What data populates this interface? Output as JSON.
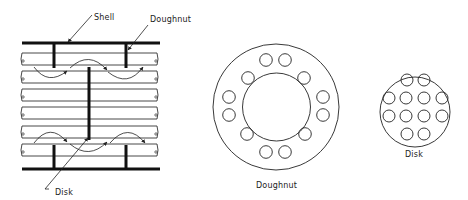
{
  "figure": {
    "side_view": {
      "labels": {
        "shell": "Shell",
        "doughnut": "Doughnut",
        "disk": "Disk"
      },
      "tube_count": 6,
      "doughnut_baffle_count": 4,
      "disk_baffle_count": 1
    },
    "doughnut_view": {
      "label": "Doughnut",
      "hole_count": 12
    },
    "disk_view": {
      "label": "Disk",
      "hole_count": 14
    },
    "colors": {
      "line": "#111111",
      "background": "#ffffff"
    }
  }
}
